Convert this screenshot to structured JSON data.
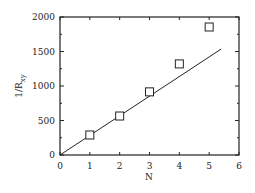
{
  "chart_data": {
    "type": "scatter",
    "title": "",
    "xlabel": "N",
    "ylabel": "1/R_xy",
    "ylabel_main": "1/R",
    "ylabel_sub": "xy",
    "xlim": [
      0,
      6
    ],
    "ylim": [
      0,
      2000
    ],
    "xticks": [
      0,
      1,
      2,
      3,
      4,
      5,
      6
    ],
    "yticks": [
      0,
      500,
      1000,
      1500,
      2000
    ],
    "grid": false,
    "legend": null,
    "series": [
      {
        "name": "data",
        "marker": "open-square",
        "x": [
          1,
          2,
          3,
          4,
          5
        ],
        "y": [
          290,
          565,
          915,
          1320,
          1855
        ]
      },
      {
        "name": "linear fit",
        "style": "line",
        "x": [
          0,
          5.4
        ],
        "y": [
          0,
          1535
        ]
      }
    ]
  }
}
